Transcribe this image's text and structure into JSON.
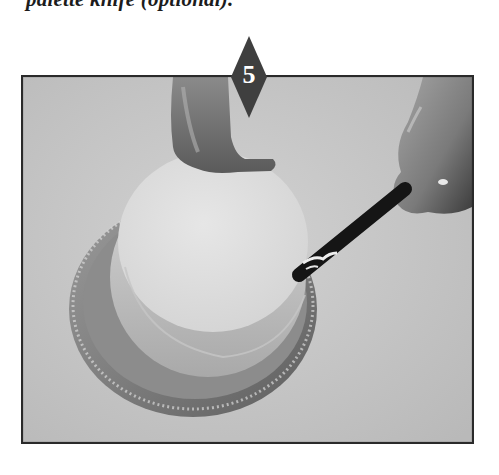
{
  "caption": {
    "text": "palette knife (optional)."
  },
  "step": {
    "number": "5",
    "marker_color": "#3f3f3f",
    "number_color": "#ffffff"
  },
  "photo": {
    "description": "Hands spreading frosting onto the side of a round cake on a turntable with a palette knife",
    "background_color": "#c9c9c9",
    "border_color": "#2a2a2a",
    "elements": {
      "cake_top": "cake-top",
      "turntable": "turntable",
      "palette_knife": "palette-knife",
      "left_hand": "left-hand",
      "right_hand": "right-hand"
    }
  }
}
